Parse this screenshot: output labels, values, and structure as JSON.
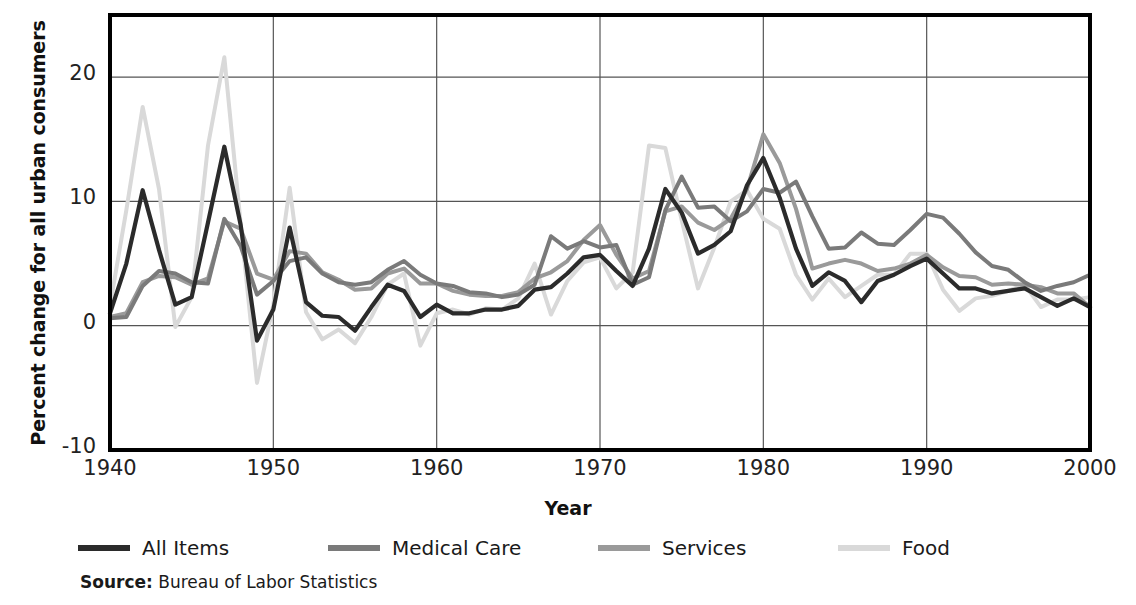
{
  "axes": {
    "ylabel": "Percent change for all urban consumers",
    "xlabel": "Year",
    "yticks": [
      "-10",
      "0",
      "10",
      "20"
    ],
    "xticks": [
      "1940",
      "1950",
      "1960",
      "1970",
      "1980",
      "1990",
      "2000"
    ]
  },
  "legend": {
    "items": [
      {
        "label": "All Items",
        "color": "#2b2b2b"
      },
      {
        "label": "Medical Care",
        "color": "#7a7a7a"
      },
      {
        "label": "Services",
        "color": "#9a9a9a"
      },
      {
        "label": "Food",
        "color": "#d9d9d9"
      }
    ]
  },
  "source": {
    "prefix": "Source:",
    "text": " Bureau of Labor Statistics"
  },
  "chart_data": {
    "type": "line",
    "title": "",
    "xlabel": "Year",
    "ylabel": "Percent change for all urban consumers",
    "xlim": [
      1940,
      2000
    ],
    "ylim": [
      -10,
      25
    ],
    "xticks": [
      1940,
      1950,
      1960,
      1970,
      1980,
      1990,
      2000
    ],
    "yticks": [
      -10,
      0,
      10,
      20
    ],
    "grid": true,
    "legend_position": "below",
    "x": [
      1940,
      1941,
      1942,
      1943,
      1944,
      1945,
      1946,
      1947,
      1948,
      1949,
      1950,
      1951,
      1952,
      1953,
      1954,
      1955,
      1956,
      1957,
      1958,
      1959,
      1960,
      1961,
      1962,
      1963,
      1964,
      1965,
      1966,
      1967,
      1968,
      1969,
      1970,
      1971,
      1972,
      1973,
      1974,
      1975,
      1976,
      1977,
      1978,
      1979,
      1980,
      1981,
      1982,
      1983,
      1984,
      1985,
      1986,
      1987,
      1988,
      1989,
      1990,
      1991,
      1992,
      1993,
      1994,
      1995,
      1996,
      1997,
      1998,
      1999,
      2000
    ],
    "series": [
      {
        "name": "All Items",
        "color": "#2b2b2b",
        "values": [
          1.0,
          5.0,
          10.9,
          6.1,
          1.7,
          2.3,
          8.3,
          14.4,
          8.1,
          -1.2,
          1.3,
          7.9,
          1.9,
          0.8,
          0.7,
          -0.4,
          1.5,
          3.3,
          2.8,
          0.7,
          1.7,
          1.0,
          1.0,
          1.3,
          1.3,
          1.6,
          2.9,
          3.1,
          4.2,
          5.5,
          5.7,
          4.4,
          3.2,
          6.2,
          11.0,
          9.1,
          5.8,
          6.5,
          7.6,
          11.3,
          13.5,
          10.3,
          6.2,
          3.2,
          4.3,
          3.6,
          1.9,
          3.6,
          4.1,
          4.8,
          5.4,
          4.2,
          3.0,
          3.0,
          2.6,
          2.8,
          3.0,
          2.3,
          1.6,
          2.2,
          1.5
        ]
      },
      {
        "name": "Medical Care",
        "color": "#7a7a7a",
        "values": [
          0.6,
          0.7,
          3.2,
          4.4,
          4.2,
          3.5,
          3.4,
          8.6,
          6.4,
          2.5,
          3.6,
          5.2,
          5.5,
          4.2,
          3.5,
          3.3,
          3.5,
          4.5,
          5.2,
          4.1,
          3.4,
          3.2,
          2.7,
          2.6,
          2.3,
          2.5,
          3.3,
          7.2,
          6.2,
          6.8,
          6.3,
          6.5,
          3.3,
          3.9,
          9.3,
          12.0,
          9.5,
          9.6,
          8.4,
          9.2,
          11.0,
          10.7,
          11.6,
          8.8,
          6.2,
          6.3,
          7.5,
          6.6,
          6.5,
          7.7,
          9.0,
          8.7,
          7.4,
          5.9,
          4.8,
          4.5,
          3.5,
          2.8,
          3.2,
          3.5,
          4.1
        ]
      },
      {
        "name": "Services",
        "color": "#9a9a9a",
        "values": [
          0.7,
          1.0,
          3.5,
          4.0,
          3.9,
          3.3,
          3.8,
          8.4,
          7.8,
          4.2,
          3.7,
          6.0,
          5.8,
          4.3,
          3.7,
          2.9,
          3.0,
          4.2,
          4.6,
          3.4,
          3.4,
          2.8,
          2.5,
          2.4,
          2.4,
          2.7,
          3.8,
          4.3,
          5.2,
          6.9,
          8.1,
          5.7,
          3.8,
          4.4,
          9.2,
          9.6,
          8.3,
          7.7,
          8.6,
          11.0,
          15.4,
          13.1,
          9.4,
          4.6,
          5.0,
          5.3,
          5.0,
          4.4,
          4.6,
          5.0,
          5.7,
          4.7,
          4.0,
          3.9,
          3.3,
          3.4,
          3.3,
          3.1,
          2.6,
          2.6,
          1.5
        ]
      },
      {
        "name": "Food",
        "color": "#d9d9d9",
        "values": [
          1.6,
          9.3,
          17.6,
          11.0,
          -0.1,
          2.3,
          14.5,
          21.6,
          8.2,
          -4.6,
          1.7,
          11.1,
          1.1,
          -1.1,
          -0.3,
          -1.4,
          0.7,
          3.3,
          4.2,
          -1.6,
          1.0,
          1.3,
          0.9,
          1.4,
          1.3,
          2.2,
          5.0,
          0.9,
          3.6,
          5.1,
          5.5,
          3.0,
          4.3,
          14.5,
          14.3,
          8.5,
          3.0,
          6.3,
          10.0,
          10.9,
          8.6,
          7.8,
          4.1,
          2.1,
          3.8,
          2.3,
          3.2,
          4.1,
          4.1,
          5.8,
          5.8,
          2.9,
          1.2,
          2.2,
          2.4,
          2.8,
          3.3,
          1.5,
          2.1,
          2.1,
          2.3
        ]
      }
    ]
  }
}
